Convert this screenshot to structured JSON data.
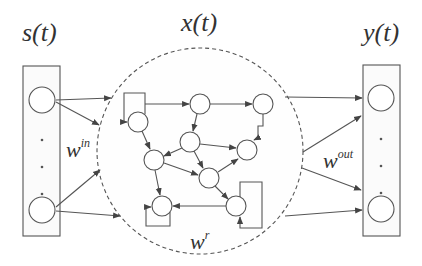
{
  "diagram": {
    "type": "echo-state-network / reservoir computing schematic",
    "input_layer": {
      "label": "s(t)"
    },
    "reservoir": {
      "label": "x(t)",
      "boundary": "dashed circle"
    },
    "output_layer": {
      "label": "y(t)"
    },
    "weights": {
      "input": {
        "base": "w",
        "sup": "in"
      },
      "reservoir": {
        "base": "w",
        "sup": "r"
      },
      "output": {
        "base": "w",
        "sup": "out"
      }
    },
    "ellipsis": "· · ·",
    "colors": {
      "stroke": "#555555",
      "text": "#333333",
      "background": "#ffffff"
    }
  }
}
